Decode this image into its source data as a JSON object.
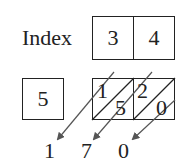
{
  "diagram": {
    "type": "lattice-multiplication",
    "index_label": "Index",
    "index_digits": [
      "3",
      "4"
    ],
    "multiplier": "5",
    "cells": [
      {
        "tens": "1",
        "ones": "5"
      },
      {
        "tens": "2",
        "ones": "0"
      }
    ],
    "result_digits": [
      "1",
      "7",
      "0"
    ],
    "colors": {
      "stroke": "#222222",
      "arrow": "#555555",
      "background": "#ffffff"
    }
  }
}
